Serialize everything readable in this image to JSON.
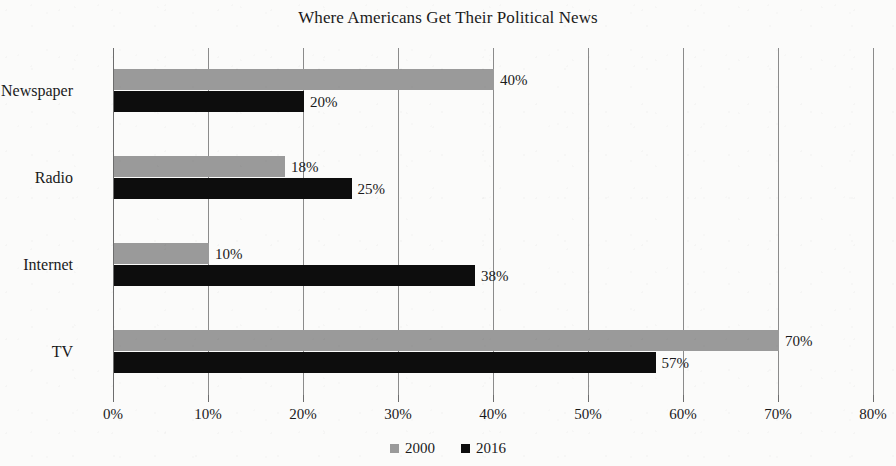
{
  "chart_data": {
    "type": "bar",
    "orientation": "horizontal",
    "title": "Where Americans Get Their Political News",
    "xlabel": "",
    "ylabel": "",
    "categories": [
      "Newspaper",
      "Radio",
      "Internet",
      "TV"
    ],
    "series": [
      {
        "name": "2000",
        "color": "#9a9a9a",
        "values": [
          40,
          18,
          10,
          70
        ],
        "labels": [
          "40%",
          "18%",
          "10%",
          "70%"
        ]
      },
      {
        "name": "2016",
        "color": "#0d0d0d",
        "values": [
          20,
          25,
          38,
          57
        ],
        "labels": [
          "20%",
          "25%",
          "38%",
          "57%"
        ]
      }
    ],
    "xlim": [
      0,
      80
    ],
    "xticks": [
      0,
      10,
      20,
      30,
      40,
      50,
      60,
      70,
      80
    ],
    "xtick_labels": [
      "0%",
      "10%",
      "20%",
      "30%",
      "40%",
      "50%",
      "60%",
      "70%",
      "80%"
    ],
    "grid": true,
    "grid_axis": "x",
    "legend_position": "bottom-center",
    "legend": [
      "2000",
      "2016"
    ],
    "value_labels_shown": true
  },
  "title": "Where Americans Get Their Political News",
  "axis": {
    "ticks": [
      {
        "value": 0,
        "label": "0%"
      },
      {
        "value": 10,
        "label": "10%"
      },
      {
        "value": 20,
        "label": "20%"
      },
      {
        "value": 30,
        "label": "30%"
      },
      {
        "value": 40,
        "label": "40%"
      },
      {
        "value": 50,
        "label": "50%"
      },
      {
        "value": 60,
        "label": "60%"
      },
      {
        "value": 70,
        "label": "70%"
      },
      {
        "value": 80,
        "label": "80%"
      }
    ]
  },
  "categories": [
    {
      "label": "Newspaper"
    },
    {
      "label": "Radio"
    },
    {
      "label": "Internet"
    },
    {
      "label": "TV"
    }
  ],
  "bars": [
    {
      "category": "Newspaper",
      "series": "2000",
      "value": 40,
      "label": "40%"
    },
    {
      "category": "Newspaper",
      "series": "2016",
      "value": 20,
      "label": "20%"
    },
    {
      "category": "Radio",
      "series": "2000",
      "value": 18,
      "label": "18%"
    },
    {
      "category": "Radio",
      "series": "2016",
      "value": 25,
      "label": "25%"
    },
    {
      "category": "Internet",
      "series": "2000",
      "value": 10,
      "label": "10%"
    },
    {
      "category": "Internet",
      "series": "2016",
      "value": 38,
      "label": "38%"
    },
    {
      "category": "TV",
      "series": "2000",
      "value": 70,
      "label": "70%"
    },
    {
      "category": "TV",
      "series": "2016",
      "value": 57,
      "label": "57%"
    }
  ],
  "legend": {
    "entries": [
      {
        "label": "2000",
        "color": "#9a9a9a"
      },
      {
        "label": "2016",
        "color": "#0d0d0d"
      }
    ]
  },
  "colors": {
    "series_2000": "#9a9a9a",
    "series_2016": "#0d0d0d",
    "gridline": "#8b8b8b",
    "text": "#1a1a1a",
    "page_background": "#fbfbfa"
  },
  "cutoff_text": ""
}
